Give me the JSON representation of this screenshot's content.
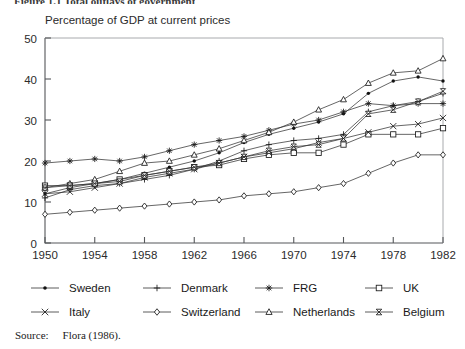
{
  "figure_title": "Figure 1.1   Total outlays of government",
  "axis_title": "Percentage of GDP at current prices",
  "source": {
    "label": "Source:",
    "text": "Flora (1986)."
  },
  "legend": {
    "rows": [
      [
        {
          "name": "Sweden",
          "marker": "dot"
        },
        {
          "name": "Denmark",
          "marker": "plus"
        },
        {
          "name": "FRG",
          "marker": "asterisk"
        },
        {
          "name": "UK",
          "marker": "square"
        }
      ],
      [
        {
          "name": "Italy",
          "marker": "cross"
        },
        {
          "name": "Switzerland",
          "marker": "diamond"
        },
        {
          "name": "Netherlands",
          "marker": "triangle"
        },
        {
          "name": "Belgium",
          "marker": "bowtie"
        }
      ]
    ]
  },
  "chart_data": {
    "type": "line",
    "title": "Percentage of GDP at current prices",
    "xlabel": "",
    "ylabel": "",
    "xlim": [
      1950,
      1982
    ],
    "ylim": [
      0,
      50
    ],
    "xticks": [
      1950,
      1954,
      1958,
      1962,
      1966,
      1970,
      1974,
      1978,
      1982
    ],
    "yticks": [
      0,
      10,
      20,
      30,
      40,
      50
    ],
    "grid": false,
    "legend_position": "below",
    "x": [
      1950,
      1952,
      1954,
      1956,
      1958,
      1960,
      1962,
      1964,
      1966,
      1968,
      1970,
      1972,
      1974,
      1976,
      1978,
      1980,
      1982
    ],
    "series": [
      {
        "name": "Sweden",
        "marker": "dot",
        "values": [
          12.0,
          13.5,
          14.5,
          15.5,
          17.0,
          18.5,
          20.0,
          22.0,
          24.5,
          26.5,
          28.0,
          29.5,
          31.5,
          36.5,
          39.5,
          40.5,
          39.5
        ]
      },
      {
        "name": "Denmark",
        "marker": "plus",
        "values": [
          11.0,
          13.0,
          14.0,
          14.5,
          15.5,
          16.5,
          18.0,
          20.0,
          22.5,
          24.0,
          25.0,
          25.5,
          26.5,
          32.0,
          33.5,
          34.5,
          36.5
        ]
      },
      {
        "name": "FRG",
        "marker": "asterisk",
        "values": [
          19.5,
          20.0,
          20.5,
          20.0,
          21.0,
          22.5,
          24.0,
          25.0,
          26.0,
          27.5,
          29.0,
          30.0,
          32.0,
          34.0,
          33.5,
          34.0,
          34.0
        ]
      },
      {
        "name": "UK",
        "marker": "square",
        "values": [
          14.0,
          14.0,
          14.5,
          15.5,
          16.5,
          17.5,
          18.5,
          19.0,
          20.5,
          21.5,
          22.0,
          22.0,
          24.0,
          26.5,
          26.5,
          26.5,
          28.0
        ]
      },
      {
        "name": "Italy",
        "marker": "cross",
        "values": [
          12.0,
          12.5,
          13.5,
          14.5,
          16.0,
          17.0,
          18.0,
          19.5,
          21.0,
          22.0,
          23.0,
          24.5,
          25.5,
          27.0,
          28.5,
          29.0,
          30.5
        ]
      },
      {
        "name": "Switzerland",
        "marker": "diamond",
        "values": [
          7.0,
          7.5,
          8.0,
          8.5,
          9.0,
          9.5,
          10.0,
          10.5,
          11.5,
          12.0,
          12.5,
          13.5,
          14.5,
          17.0,
          19.5,
          21.5,
          21.5
        ]
      },
      {
        "name": "Netherlands",
        "marker": "triangle",
        "values": [
          13.5,
          14.5,
          15.5,
          17.5,
          19.5,
          20.0,
          21.5,
          23.0,
          25.0,
          27.0,
          29.5,
          32.5,
          35.0,
          39.0,
          41.5,
          42.0,
          45.0
        ]
      },
      {
        "name": "Belgium",
        "marker": "bowtie",
        "values": [
          13.5,
          14.0,
          14.5,
          15.0,
          16.5,
          17.5,
          18.5,
          19.5,
          21.0,
          22.5,
          23.5,
          24.0,
          25.5,
          31.5,
          32.5,
          34.5,
          37.0
        ]
      }
    ]
  }
}
